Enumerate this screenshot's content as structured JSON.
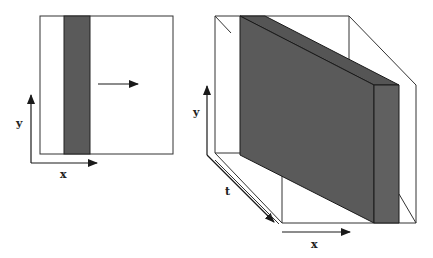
{
  "colors": {
    "slab_fill": "#5a5a5a",
    "slab_top": "#555555",
    "line": "#1a1a1a",
    "background": "#ffffff"
  },
  "left_panel": {
    "axes": {
      "x_label": "x",
      "y_label": "y"
    },
    "motion_arrow": "right-arrow"
  },
  "right_panel": {
    "axes": {
      "x_label": "x",
      "y_label": "y",
      "t_label": "t"
    }
  }
}
